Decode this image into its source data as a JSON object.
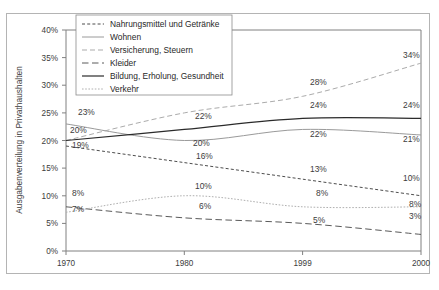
{
  "chart_data": {
    "type": "line",
    "title": "",
    "xlabel": "",
    "ylabel": "Ausgabenverteilung in Privathaushalten",
    "x": [
      "1970",
      "1980",
      "1999",
      "2000"
    ],
    "categories": [
      "1970",
      "1980",
      "1999",
      "2000"
    ],
    "ylim": [
      0,
      40
    ],
    "ytick_labels": [
      "0%",
      "5%",
      "10%",
      "15%",
      "20%",
      "25%",
      "30%",
      "35%",
      "40%"
    ],
    "ytick_values": [
      0,
      5,
      10,
      15,
      20,
      25,
      30,
      35,
      40
    ],
    "grid": false,
    "legend_position": "top-left-inside",
    "series": [
      {
        "name": "Nahrungsmittel und Getränke",
        "values": [
          19,
          16,
          13,
          10
        ],
        "labels": [
          "19%",
          "16%",
          "13%",
          "10%"
        ],
        "color": "#4d4d4d",
        "dash": "3,2.2",
        "width": 1.0
      },
      {
        "name": "Wohnen",
        "values": [
          23,
          20,
          22,
          21
        ],
        "labels": [
          "23%",
          "20%",
          "22%",
          "21%"
        ],
        "color": "#9a9a9a",
        "dash": "none",
        "width": 1.0
      },
      {
        "name": "Versicherung, Steuern",
        "values": [
          20,
          25,
          28,
          34
        ],
        "labels": [
          "20%",
          "",
          "28%",
          "34%"
        ],
        "color": "#ababab",
        "dash": "5,3",
        "width": 1.0
      },
      {
        "name": "Kleider",
        "values": [
          8,
          6,
          5,
          3
        ],
        "labels": [
          "8%",
          "6%",
          "5%",
          "3%"
        ],
        "color": "#5a5a5a",
        "dash": "6.5,3.5",
        "width": 1.0
      },
      {
        "name": "Bildung, Erholung, Gesundheit",
        "values": [
          20,
          22,
          24,
          24
        ],
        "labels": [
          "20%",
          "22%",
          "24%",
          "24%"
        ],
        "color": "#2b2b2b",
        "dash": "none",
        "width": 1.2
      },
      {
        "name": "Verkehr",
        "values": [
          7,
          10,
          8,
          8
        ],
        "labels": [
          "7%",
          "10%",
          "8%",
          "8%"
        ],
        "color": "#b0b0b0",
        "dash": "1.6,1.6",
        "width": 1.0
      }
    ],
    "annotations": [
      {
        "text": "23%",
        "x": 78,
        "y": 115
      },
      {
        "text": "20%",
        "x": 70,
        "y": 133
      },
      {
        "text": "19%",
        "x": 72,
        "y": 148
      },
      {
        "text": "8%",
        "x": 72,
        "y": 196
      },
      {
        "text": "7%",
        "x": 72,
        "y": 212
      },
      {
        "text": "22%",
        "x": 195,
        "y": 119
      },
      {
        "text": "20%",
        "x": 193,
        "y": 146
      },
      {
        "text": "16%",
        "x": 196,
        "y": 159
      },
      {
        "text": "10%",
        "x": 195,
        "y": 189
      },
      {
        "text": "6%",
        "x": 199,
        "y": 209
      },
      {
        "text": "28%",
        "x": 310,
        "y": 85
      },
      {
        "text": "24%",
        "x": 310,
        "y": 108
      },
      {
        "text": "22%",
        "x": 310,
        "y": 137
      },
      {
        "text": "13%",
        "x": 310,
        "y": 172
      },
      {
        "text": "8%",
        "x": 316,
        "y": 196
      },
      {
        "text": "5%",
        "x": 313,
        "y": 223
      },
      {
        "text": "34%",
        "x": 403,
        "y": 58
      },
      {
        "text": "24%",
        "x": 403,
        "y": 108
      },
      {
        "text": "21%",
        "x": 403,
        "y": 142
      },
      {
        "text": "10%",
        "x": 403,
        "y": 181
      },
      {
        "text": "8%",
        "x": 409,
        "y": 207
      },
      {
        "text": "3%",
        "x": 409,
        "y": 219
      }
    ]
  },
  "legend": {
    "items": [
      {
        "label": "Nahrungsmittel und Getränke"
      },
      {
        "label": "Wohnen"
      },
      {
        "label": "Versicherung, Steuern"
      },
      {
        "label": "Kleider"
      },
      {
        "label": "Bildung, Erholung, Gesundheit"
      },
      {
        "label": "Verkehr"
      }
    ]
  },
  "axes": {
    "y_title": "Ausgabenverteilung in Privathaushalten",
    "y_ticks": [
      "40%",
      "35%",
      "30%",
      "25%",
      "20%",
      "15%",
      "10%",
      "5%",
      "0%"
    ],
    "x_ticks": [
      "1970",
      "1980",
      "1999",
      "2000"
    ]
  }
}
